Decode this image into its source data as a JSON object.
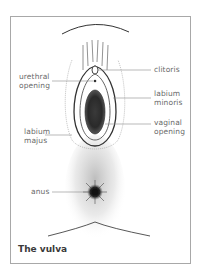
{
  "figure": {
    "caption": "The vulva",
    "colors": {
      "frame": "#a8a8a8",
      "label_text": "#6a6a6a",
      "caption_text": "#3a3a3a",
      "leader_line": "#8a8a8a",
      "ink": "#2a2a2a"
    },
    "labels": {
      "urethral_opening": "urethral\nopening",
      "labium_majus": "labium\nmajus",
      "anus": "anus",
      "clitoris": "clitoris",
      "labium_minoris": "labium\nminoris",
      "vaginal_opening": "vaginal\nopening"
    }
  }
}
